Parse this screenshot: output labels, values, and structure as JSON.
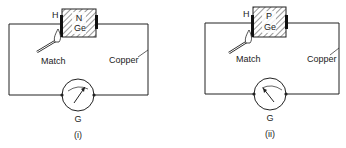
{
  "diagrams": [
    {
      "caption": "(i)",
      "semiconductor_type": "N",
      "material": "Ge",
      "hot_end_label": "H",
      "heat_source_label": "Match",
      "wire_label": "Copper",
      "meter_label": "G",
      "needle_deflection": "right"
    },
    {
      "caption": "(ii)",
      "semiconductor_type": "P",
      "material": "Ge",
      "hot_end_label": "H",
      "heat_source_label": "Match",
      "wire_label": "Copper",
      "meter_label": "G",
      "needle_deflection": "left"
    }
  ],
  "colors": {
    "line": "#222222",
    "background": "#ffffff"
  }
}
